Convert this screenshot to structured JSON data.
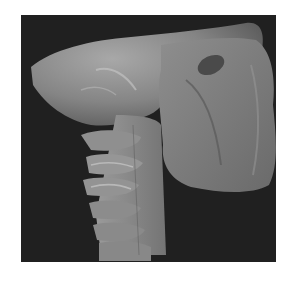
{
  "image": {
    "description": "Grayscale 3D volume rendering of a skull and cervical spine, lateral view",
    "background_color": "#202020",
    "bone_color": "#8a8a8a",
    "highlight_color": "#c8c8c8",
    "page_background": "#ffffff"
  }
}
